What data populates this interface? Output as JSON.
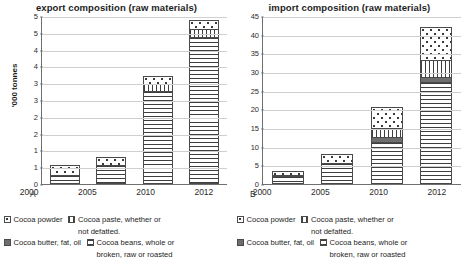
{
  "figure": {
    "panels": [
      {
        "letter": "A",
        "title": "export composition (raw materials)",
        "ylabel": "'000 tonnes"
      },
      {
        "letter": "B",
        "title": "import composition (raw materials)",
        "ylabel": ""
      }
    ],
    "legend": {
      "items": [
        {
          "label": "Cocoa powder",
          "pattern": "dotted"
        },
        {
          "label": "Cocoa paste, whether or not defatted.",
          "pattern": "vertical-lines"
        },
        {
          "label": "Cocoa butter, fat, oil",
          "pattern": "solid-gray"
        },
        {
          "label": "Cocoa beans, whole or broken, raw or roasted",
          "pattern": "horizontal-lines"
        }
      ]
    }
  },
  "chart_data": [
    {
      "type": "bar",
      "id": "export-composition",
      "panel_letter": "A",
      "title": "export composition (raw materials)",
      "xlabel": "",
      "ylabel": "'000 tonnes",
      "ylim": [
        0,
        5
      ],
      "ytick_step": 0.5,
      "yticks": [
        0,
        0.5,
        1,
        1.5,
        2,
        2.5,
        3,
        3.5,
        4,
        4.5,
        5
      ],
      "ytick_labels": [
        "0",
        "1",
        "1",
        "2",
        "2",
        "3",
        "3",
        "4",
        "4",
        "5",
        "5"
      ],
      "grid": true,
      "stacked": true,
      "legend_position": "bottom",
      "categories": [
        "2000",
        "2005",
        "2010",
        "2012"
      ],
      "series": [
        {
          "name": "Cocoa beans, whole or broken, raw or roasted",
          "values": [
            0.25,
            0.55,
            2.75,
            4.35
          ]
        },
        {
          "name": "Cocoa butter, fat, oil",
          "values": [
            0.0,
            0.0,
            0.0,
            0.0
          ]
        },
        {
          "name": "Cocoa paste, whether or not defatted.",
          "values": [
            0.0,
            0.0,
            0.2,
            0.22
          ]
        },
        {
          "name": "Cocoa powder",
          "values": [
            0.25,
            0.2,
            0.2,
            0.25
          ]
        }
      ],
      "totals": [
        0.5,
        0.75,
        3.15,
        4.82
      ]
    },
    {
      "type": "bar",
      "id": "import-composition",
      "panel_letter": "B",
      "title": "import composition (raw materials)",
      "xlabel": "",
      "ylabel": "",
      "ylim": [
        0,
        45
      ],
      "ytick_step": 5,
      "yticks": [
        0,
        5,
        10,
        15,
        20,
        25,
        30,
        35,
        40,
        45
      ],
      "ytick_labels": [
        "0",
        "5",
        "10",
        "15",
        "20",
        "25",
        "30",
        "35",
        "40",
        "45"
      ],
      "grid": true,
      "stacked": true,
      "legend_position": "bottom",
      "categories": [
        "2000",
        "2005",
        "2010",
        "2012"
      ],
      "series": [
        {
          "name": "Cocoa beans, whole or broken, raw or roasted",
          "values": [
            1.8,
            5.3,
            11.0,
            27.0
          ]
        },
        {
          "name": "Cocoa butter, fat, oil",
          "values": [
            0.3,
            0.0,
            1.3,
            1.5
          ]
        },
        {
          "name": "Cocoa paste, whether or not defatted.",
          "values": [
            0.0,
            0.0,
            2.5,
            4.5
          ]
        },
        {
          "name": "Cocoa powder",
          "values": [
            0.8,
            2.2,
            5.2,
            8.5
          ]
        }
      ],
      "totals": [
        2.9,
        7.5,
        20.0,
        41.5
      ]
    }
  ]
}
